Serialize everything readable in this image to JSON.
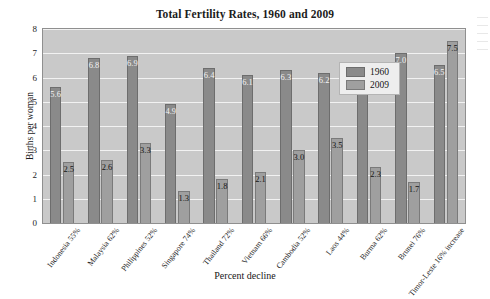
{
  "chart_data": {
    "type": "bar",
    "title": "Total Fertility Rates, 1960 and 2009",
    "xlabel": "Percent decline",
    "ylabel": "Births per woman",
    "ylim": [
      0,
      8
    ],
    "yticks": [
      "0",
      "1",
      "2",
      "3",
      "4",
      "5",
      "6",
      "7",
      "8"
    ],
    "grid": true,
    "legend_position": "top-right",
    "categories": [
      "Indonesia",
      "Malaysia",
      "Philippines",
      "Singapore",
      "Thailand",
      "Vietnam",
      "Cambodia",
      "Laos",
      "Burma",
      "Brunei",
      "Timor-Leste"
    ],
    "category_sublabels": [
      "55%",
      "62%",
      "52%",
      "74%",
      "72%",
      "66%",
      "52%",
      "44%",
      "62%",
      "76%",
      "16% increase"
    ],
    "series": [
      {
        "name": "1960",
        "color": "#8a8a8a",
        "values": [
          5.6,
          6.8,
          6.9,
          4.9,
          6.4,
          6.1,
          6.3,
          6.2,
          6.0,
          7.0,
          6.5
        ]
      },
      {
        "name": "2009",
        "color": "#9f9f9f",
        "values": [
          2.5,
          2.6,
          3.3,
          1.3,
          1.8,
          2.1,
          3.0,
          3.5,
          2.3,
          1.7,
          7.5
        ]
      }
    ],
    "value_labels": {
      "1960": [
        "5.6",
        "6.8",
        "6.9",
        "4.9",
        "6.4",
        "6.1",
        "6.3",
        "6.2",
        "6.0",
        "7.0",
        "6.5"
      ],
      "2009": [
        "2.5",
        "2.6",
        "3.3",
        "1.3",
        "1.8",
        "2.1",
        "3.0",
        "3.5",
        "2.3",
        "1.7",
        "7.5"
      ]
    }
  }
}
